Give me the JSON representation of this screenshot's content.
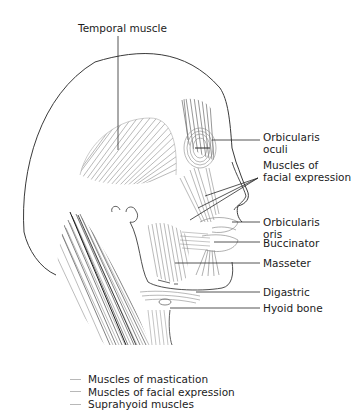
{
  "figure": {
    "colors": {
      "outline": "#3a3a3a",
      "muscle_fibers": "#8a8a8a",
      "dark_fibers": "#4a4a4a",
      "leader_line": "#2a2a2a",
      "legend_dash": "#b8b8b8"
    }
  },
  "labels": {
    "temporal_muscle": "Temporal muscle",
    "orbicularis_oculi_1": "Orbicularis",
    "orbicularis_oculi_2": "oculi",
    "facial_expression_1": "Muscles of",
    "facial_expression_2": "facial expression",
    "orbicularis_oris_1": "Orbicularis",
    "orbicularis_oris_2": "oris",
    "buccinator": "Buccinator",
    "masseter": "Masseter",
    "digastric": "Digastric",
    "hyoid_bone": "Hyoid bone"
  },
  "legend": {
    "items": [
      {
        "label": "Muscles of mastication"
      },
      {
        "label": "Muscles of facial expression"
      },
      {
        "label": "Suprahyoid muscles"
      }
    ]
  }
}
